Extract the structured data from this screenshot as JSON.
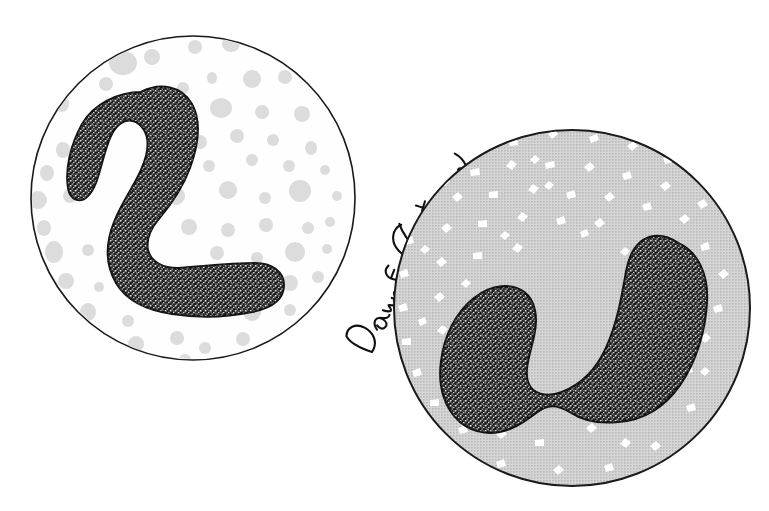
{
  "figure": {
    "artist_signature": "Dawn E. Christenson",
    "faint_caption": "",
    "background_color": "#ffffff",
    "outline_color": "#1a1a1a",
    "nucleus_color": "#1c1c1c",
    "nucleus_stipple_color": "#ffffff"
  },
  "cells": [
    {
      "id": "cell-left",
      "label": "unstained-band-neutrophil",
      "cytoplasm_style": "pale",
      "cytoplasm_color": "#fefefe",
      "granule_color": "#d9d9d9",
      "granule_style": "filled-gray-dots",
      "circle": {
        "cx": 193,
        "cy": 198,
        "r": 162
      },
      "nucleus_shape": "hook-band-L-shaped",
      "granule_count": 62
    },
    {
      "id": "cell-right",
      "label": "stained-band-neutrophil",
      "cytoplasm_style": "gray-halftone",
      "cytoplasm_color": "#c9c9c9",
      "granule_color": "#ffffff",
      "granule_style": "white-irregular-speckles",
      "circle": {
        "cx": 572,
        "cy": 308,
        "r": 178
      },
      "nucleus_shape": "horseshoe-U-shaped",
      "granule_count": 150
    }
  ],
  "signature": {
    "text": "Dawn E. Christenson",
    "x": 372,
    "y": 344,
    "rotation_deg": -62,
    "color": "#111111"
  }
}
